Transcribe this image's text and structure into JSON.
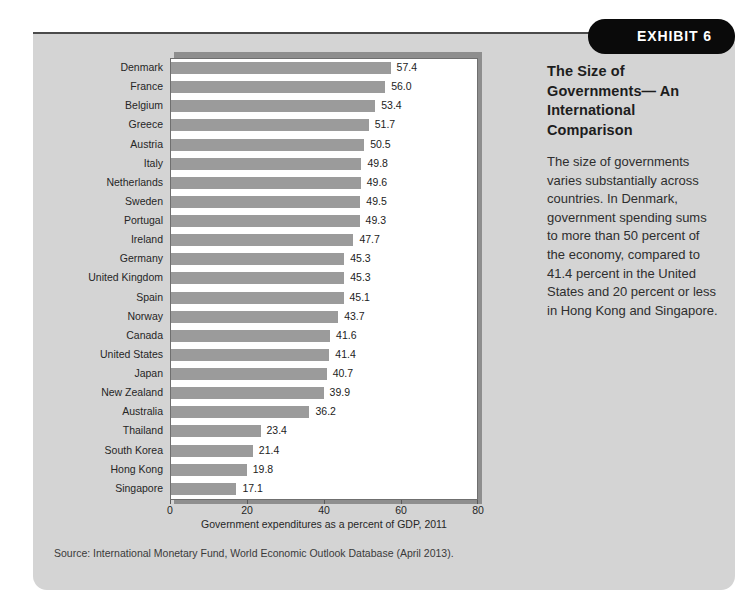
{
  "exhibit": {
    "pill_label": "EXHIBIT 6",
    "title": "The Size of Governments— An International Comparison",
    "body": "The size of governments varies substantially across countries. In Denmark, government spending sums to more than 50 percent of the economy, compared to 41.4 percent in the United States and 20 percent or less in Hong Kong and Singapore.",
    "source": "Source: International Monetary Fund, World Economic Outlook Database (April 2013)."
  },
  "colors": {
    "panel_background": "#d4d4d4",
    "bar": "#9b9b9b",
    "pill_background": "#0a0a0a",
    "rule": "#4b4b4b",
    "plot_background": "#ffffff"
  },
  "chart_data": {
    "type": "bar",
    "orientation": "horizontal",
    "title": "The Size of Governments— An International Comparison",
    "xlabel": "Government expenditures as a percent of GDP, 2011",
    "ylabel": "",
    "xlim": [
      0,
      80
    ],
    "xticks": [
      0,
      20,
      40,
      60,
      80
    ],
    "xtick_labels": [
      "0",
      "20",
      "40",
      "60",
      "80"
    ],
    "grid": false,
    "legend": false,
    "categories": [
      "Denmark",
      "France",
      "Belgium",
      "Greece",
      "Austria",
      "Italy",
      "Netherlands",
      "Sweden",
      "Portugal",
      "Ireland",
      "Germany",
      "United Kingdom",
      "Spain",
      "Norway",
      "Canada",
      "United States",
      "Japan",
      "New Zealand",
      "Australia",
      "Thailand",
      "South Korea",
      "Hong Kong",
      "Singapore"
    ],
    "values": [
      57.4,
      56.0,
      53.4,
      51.7,
      50.5,
      49.8,
      49.6,
      49.5,
      49.3,
      47.7,
      45.3,
      45.3,
      45.1,
      43.7,
      41.6,
      41.4,
      40.7,
      39.9,
      36.2,
      23.4,
      21.4,
      19.8,
      17.1
    ],
    "value_labels": [
      "57.4",
      "56.0",
      "53.4",
      "51.7",
      "50.5",
      "49.8",
      "49.6",
      "49.5",
      "49.3",
      "47.7",
      "45.3",
      "45.3",
      "45.1",
      "43.7",
      "41.6",
      "41.4",
      "40.7",
      "39.9",
      "36.2",
      "23.4",
      "21.4",
      "19.8",
      "17.1"
    ]
  }
}
